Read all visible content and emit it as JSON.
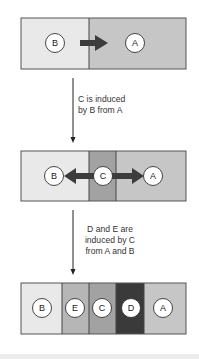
{
  "stages": [
    {
      "regions": [
        {
          "label": "B",
          "x": 21,
          "w": 68,
          "color": "#e9e9e9",
          "circle_x": 55
        },
        {
          "label": "A",
          "x": 89,
          "w": 97,
          "color": "#c6c6c6",
          "circle_x": 135
        }
      ],
      "arrows": [
        {
          "from": "B",
          "to": "A"
        }
      ]
    },
    {
      "regions": [
        {
          "label": "B",
          "x": 21,
          "w": 68,
          "color": "#e9e9e9",
          "circle_x": 54
        },
        {
          "label": "C",
          "x": 89,
          "w": 27,
          "color": "#a2a2a2",
          "circle_x": 103
        },
        {
          "label": "A",
          "x": 116,
          "w": 70,
          "color": "#c6c6c6",
          "circle_x": 153
        }
      ],
      "arrows": [
        {
          "from": "C",
          "to": "B"
        },
        {
          "from": "C",
          "to": "A"
        }
      ]
    },
    {
      "regions": [
        {
          "label": "B",
          "x": 21,
          "w": 41,
          "color": "#e9e9e9",
          "circle_x": 42
        },
        {
          "label": "E",
          "x": 62,
          "w": 27,
          "color": "#b6b6b6",
          "circle_x": 75
        },
        {
          "label": "C",
          "x": 89,
          "w": 27,
          "color": "#a2a2a2",
          "circle_x": 102
        },
        {
          "label": "D",
          "x": 116,
          "w": 28,
          "color": "#3a3a3a",
          "circle_x": 131
        },
        {
          "label": "A",
          "x": 144,
          "w": 42,
          "color": "#c6c6c6",
          "circle_x": 163
        }
      ]
    }
  ],
  "transitions": [
    {
      "caption_lines": [
        "C is induced",
        "by B from A"
      ]
    },
    {
      "caption_lines": [
        "D and E are",
        "induced by C",
        "from A and B"
      ]
    }
  ],
  "labels": {
    "stage1": {
      "b": "B",
      "a": "A"
    },
    "stage2": {
      "b": "B",
      "c": "C",
      "a": "A"
    },
    "stage3": {
      "b": "B",
      "e": "E",
      "c": "C",
      "d": "D",
      "a": "A"
    }
  },
  "captions": {
    "step1": {
      "line1": "C is induced",
      "line2": "by B from A"
    },
    "step2": {
      "line1": "D and E are",
      "line2": "induced by C",
      "line3": "from A and B"
    }
  }
}
